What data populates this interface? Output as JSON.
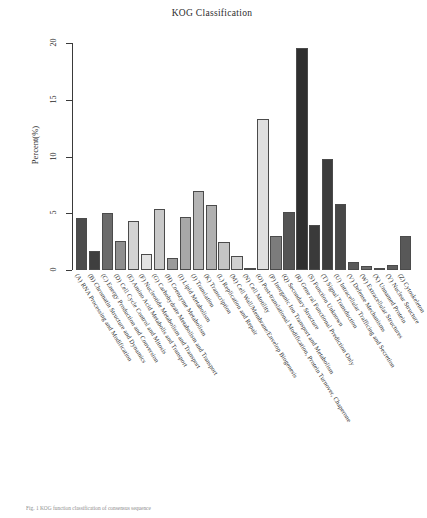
{
  "chart_data": {
    "type": "bar",
    "title": "KOG Classification",
    "xlabel": "",
    "ylabel": "Percent(%)",
    "ylim": [
      0,
      20
    ],
    "yticks": [
      0,
      5,
      10,
      15,
      20
    ],
    "grid": false,
    "legend": "none",
    "categories": [
      "(A) RNA Processing and Modification",
      "(B) Chromatin Structure and Dynamics",
      "(C) Energy Production and Conversion",
      "(D) Cell Cycle Control and Mitosis",
      "(E) Amino Acid Metabolis and Transport",
      "(F) Nucleotide Metabolism and Transport",
      "(G) Carbohydrate Metabolism and Transport",
      "(H) Coenzyme Metabolism",
      "(I) Lipid Metabolism",
      "(J) Translation",
      "(K) Transcription",
      "(L) Replication and Repair",
      "(M) Cell Wall/Membrane/Envelop Biogenesis",
      "(N) Cell Motility",
      "(O) Post-translational Modification, Protein Turnover, Chaperone",
      "(P) Inorganic Ion Transport and Metabolism",
      "(Q) Secondary Structure",
      "(R) Gene ral Functional Prediction Only",
      "(S) Function Unknown",
      "(T) Signal Transduction",
      "(U) Intracellular Trafficing and Secretion",
      "(V) Defense Mechanisms",
      "(W) Extracellular Structures",
      "(X) Unnamed Protein",
      "(Y) Nuclear Structure",
      "(Z) Cytoskeleton"
    ],
    "values": [
      4.6,
      1.7,
      5.0,
      2.6,
      4.3,
      1.4,
      5.4,
      1.1,
      4.7,
      7.0,
      5.7,
      2.5,
      1.2,
      0.08,
      13.3,
      3.0,
      5.1,
      19.6,
      4.0,
      9.8,
      5.8,
      0.7,
      0.35,
      0.05,
      0.4,
      3.0
    ],
    "bar_colors": [
      "#4c4c4c",
      "#3f3f3f",
      "#6b6b6b",
      "#8f8f8f",
      "#d3d3d3",
      "#e3e3e3",
      "#c9c9c9",
      "#9b9b9b",
      "#a8a8a8",
      "#b4b4b4",
      "#b0b0b0",
      "#c4c4c4",
      "#d0d0d0",
      "#6f6f6f",
      "#e0e0e0",
      "#7c7c7c",
      "#545454",
      "#2f2f2f",
      "#3a3a3a",
      "#3c3c3c",
      "#474747",
      "#5a5a5a",
      "#6a6a6a",
      "#6d6d6d",
      "#5e5e5e",
      "#585858"
    ],
    "accent_color": "#2f2f2f",
    "axis_color": "#3a3a3a"
  },
  "caption": {
    "text": "Fig. 1  KOG function classification of consensus sequence"
  }
}
